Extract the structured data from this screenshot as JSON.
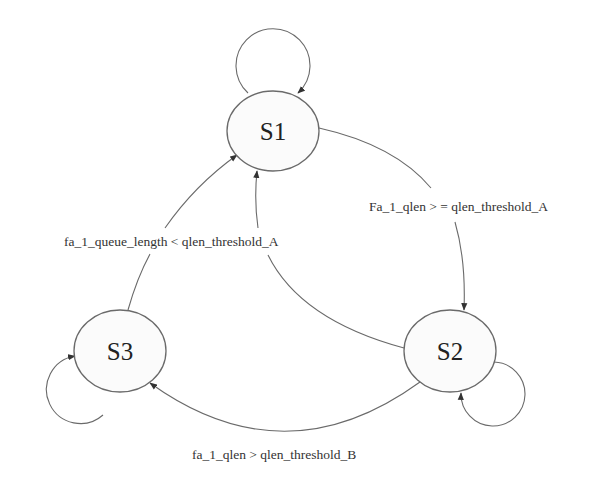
{
  "diagram": {
    "type": "state-machine",
    "states": [
      {
        "id": "S1",
        "label": "S1"
      },
      {
        "id": "S2",
        "label": "S2"
      },
      {
        "id": "S3",
        "label": "S3"
      }
    ],
    "transitions": [
      {
        "from": "S1",
        "to": "S1",
        "label": ""
      },
      {
        "from": "S2",
        "to": "S2",
        "label": ""
      },
      {
        "from": "S3",
        "to": "S3",
        "label": ""
      },
      {
        "from": "S1",
        "to": "S2",
        "label": "Fa_1_qlen > = qlen_threshold_A"
      },
      {
        "from": "S3",
        "to": "S1",
        "label": "fa_1_queue_length < qlen_threshold_A"
      },
      {
        "from": "S2",
        "to": "S1",
        "label": ""
      },
      {
        "from": "S2",
        "to": "S3",
        "label": "fa_1_qlen > qlen_threshold_B"
      }
    ]
  },
  "colors": {
    "stroke": "#6a6a6a",
    "state_fill": "#fbfbfb",
    "text": "#222222"
  }
}
